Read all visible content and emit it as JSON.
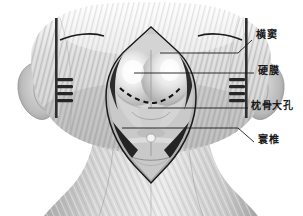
{
  "figure": {
    "view": "posterior view of head and neck",
    "style": "grayscale medical illustration",
    "background_color": "#ffffff",
    "line_color": "#1a1a1a",
    "skin_light": "#e8e8e8",
    "skin_mid": "#bdbdbd",
    "skin_dark": "#8f8f8f",
    "dura_highlight": "#f2f2f2",
    "muscle_dark": "#2b2b2b"
  },
  "labels": [
    {
      "id": "transverse-sinus",
      "text": "横窦",
      "meaning": "transverse sinus",
      "leader": {
        "from_x": 252,
        "from_y": 40,
        "bend_x": 238,
        "bend_y": 53,
        "to_x": 160,
        "to_y": 53
      }
    },
    {
      "id": "dura-mater",
      "text": "硬膜",
      "meaning": "dura mater",
      "leader": {
        "from_x": 254,
        "from_y": 73,
        "bend_x": 254,
        "bend_y": 73,
        "to_x": 134,
        "to_y": 73
      }
    },
    {
      "id": "foramen-magnum",
      "text": "枕骨大孔",
      "meaning": "foramen magnum",
      "leader": {
        "from_x": 248,
        "from_y": 108,
        "bend_x": 248,
        "bend_y": 108,
        "to_x": 148,
        "to_y": 108
      }
    },
    {
      "id": "atlas",
      "text": "寰椎",
      "meaning": "atlas (C1 vertebra)",
      "leader": {
        "from_x": 254,
        "from_y": 142,
        "bend_x": 238,
        "bend_y": 128,
        "to_x": 122,
        "to_y": 128
      }
    }
  ],
  "anatomy_parts": [
    {
      "name": "hair-scalp",
      "note": "striated hair texture over cranium"
    },
    {
      "name": "left-ear",
      "note": "auricle at left margin"
    },
    {
      "name": "right-ear",
      "note": "auricle at right margin"
    },
    {
      "name": "skin-flap-outline",
      "note": "curvilinear craniotomy skin incision"
    },
    {
      "name": "retractor-left",
      "note": "self-retaining retractor with teeth"
    },
    {
      "name": "retractor-right",
      "note": "self-retaining retractor with teeth"
    },
    {
      "name": "muscle-edge-left",
      "note": "reflected suboccipital muscle"
    },
    {
      "name": "muscle-edge-right",
      "note": "reflected suboccipital muscle"
    },
    {
      "name": "dura-dome",
      "note": "exposed cerebellar dura"
    },
    {
      "name": "dural-incision-dashed",
      "note": "planned dural opening, dashed arc"
    },
    {
      "name": "foramen-magnum-rim",
      "note": "bony rim inferiorly"
    },
    {
      "name": "atlas-arch",
      "note": "posterior arch of C1"
    },
    {
      "name": "neck",
      "note": "posterior neck and shoulders"
    }
  ]
}
